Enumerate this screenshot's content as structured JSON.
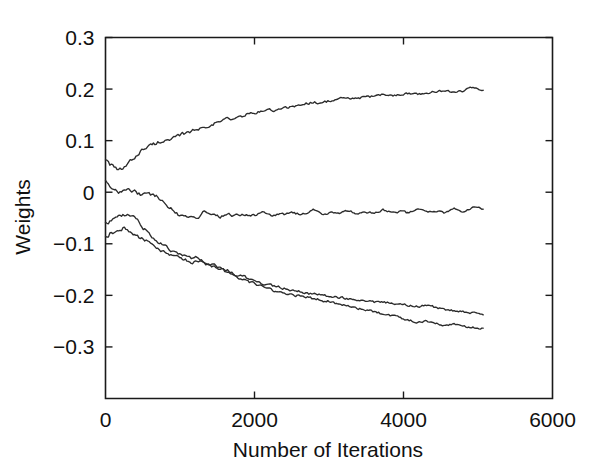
{
  "chart_data": {
    "type": "line",
    "title": "",
    "xlabel": "Number of Iterations",
    "ylabel": "Weights",
    "xlim": [
      0,
      6000
    ],
    "ylim": [
      -0.4,
      0.3
    ],
    "xticks": [
      0,
      2000,
      4000,
      6000
    ],
    "xtick_labels": [
      "0",
      "2000",
      "4000",
      "6000"
    ],
    "yticks": [
      -0.3,
      -0.2,
      -0.1,
      0,
      0.1,
      0.2,
      0.3
    ],
    "ytick_labels": [
      "−0.3",
      "−0.2",
      "−0.1",
      "0",
      "0.1",
      "0.2",
      "0.3"
    ],
    "grid": false,
    "legend": null,
    "x_data_range": [
      0,
      5070
    ],
    "line_color": "#2b2b2b",
    "series": [
      {
        "name": "weight-1",
        "start_value": 0.066,
        "end_value": 0.196,
        "x": [
          0,
          60,
          120,
          180,
          240,
          300,
          360,
          420,
          480,
          540,
          600,
          680,
          760,
          840,
          920,
          1000,
          1080,
          1160,
          1240,
          1320,
          1400,
          1480,
          1560,
          1640,
          1720,
          1800,
          1900,
          2000,
          2100,
          2200,
          2300,
          2400,
          2500,
          2600,
          2700,
          2800,
          2900,
          3000,
          3120,
          3240,
          3360,
          3480,
          3600,
          3720,
          3840,
          3960,
          4080,
          4200,
          4320,
          4440,
          4560,
          4680,
          4800,
          4920,
          5070
        ],
        "values": [
          0.066,
          0.055,
          0.046,
          0.041,
          0.046,
          0.054,
          0.063,
          0.073,
          0.081,
          0.086,
          0.09,
          0.095,
          0.101,
          0.099,
          0.104,
          0.11,
          0.115,
          0.119,
          0.122,
          0.126,
          0.131,
          0.134,
          0.139,
          0.143,
          0.141,
          0.146,
          0.151,
          0.153,
          0.157,
          0.16,
          0.158,
          0.163,
          0.166,
          0.169,
          0.172,
          0.175,
          0.173,
          0.177,
          0.18,
          0.183,
          0.181,
          0.184,
          0.186,
          0.189,
          0.187,
          0.19,
          0.192,
          0.19,
          0.193,
          0.195,
          0.197,
          0.194,
          0.197,
          0.203,
          0.196
        ]
      },
      {
        "name": "weight-2",
        "start_value": 0.02,
        "end_value": -0.032,
        "x": [
          0,
          60,
          120,
          180,
          240,
          300,
          360,
          420,
          480,
          540,
          600,
          680,
          760,
          840,
          920,
          1000,
          1080,
          1160,
          1240,
          1320,
          1400,
          1480,
          1560,
          1640,
          1720,
          1800,
          1900,
          2000,
          2100,
          2200,
          2300,
          2400,
          2500,
          2600,
          2700,
          2800,
          2900,
          3000,
          3120,
          3240,
          3360,
          3480,
          3600,
          3720,
          3840,
          3960,
          4080,
          4200,
          4320,
          4440,
          4560,
          4680,
          4800,
          4920,
          5070
        ],
        "values": [
          0.02,
          0.014,
          0.006,
          -0.001,
          0.004,
          0.006,
          0.004,
          -0.001,
          -0.004,
          -0.002,
          -0.004,
          -0.008,
          -0.016,
          -0.026,
          -0.037,
          -0.046,
          -0.047,
          -0.046,
          -0.05,
          -0.038,
          -0.045,
          -0.047,
          -0.047,
          -0.04,
          -0.047,
          -0.044,
          -0.042,
          -0.046,
          -0.038,
          -0.045,
          -0.042,
          -0.044,
          -0.038,
          -0.043,
          -0.041,
          -0.035,
          -0.042,
          -0.04,
          -0.042,
          -0.035,
          -0.041,
          -0.039,
          -0.041,
          -0.034,
          -0.04,
          -0.038,
          -0.04,
          -0.033,
          -0.039,
          -0.038,
          -0.04,
          -0.031,
          -0.038,
          -0.029,
          -0.032
        ]
      },
      {
        "name": "weight-3",
        "start_value": -0.06,
        "end_value": -0.236,
        "x": [
          0,
          60,
          120,
          180,
          240,
          300,
          360,
          420,
          480,
          540,
          600,
          680,
          760,
          840,
          920,
          1000,
          1080,
          1160,
          1240,
          1320,
          1400,
          1480,
          1560,
          1640,
          1720,
          1800,
          1900,
          2000,
          2100,
          2200,
          2300,
          2400,
          2500,
          2600,
          2700,
          2800,
          2900,
          3000,
          3120,
          3240,
          3360,
          3480,
          3600,
          3720,
          3840,
          3960,
          4080,
          4200,
          4320,
          4440,
          4560,
          4680,
          4800,
          4920,
          5070
        ],
        "values": [
          -0.06,
          -0.058,
          -0.05,
          -0.046,
          -0.044,
          -0.043,
          -0.048,
          -0.055,
          -0.064,
          -0.074,
          -0.084,
          -0.094,
          -0.1,
          -0.108,
          -0.118,
          -0.122,
          -0.126,
          -0.13,
          -0.127,
          -0.134,
          -0.14,
          -0.143,
          -0.148,
          -0.152,
          -0.158,
          -0.162,
          -0.166,
          -0.17,
          -0.176,
          -0.18,
          -0.183,
          -0.186,
          -0.19,
          -0.193,
          -0.196,
          -0.198,
          -0.2,
          -0.203,
          -0.204,
          -0.206,
          -0.209,
          -0.211,
          -0.213,
          -0.212,
          -0.216,
          -0.218,
          -0.22,
          -0.222,
          -0.219,
          -0.224,
          -0.228,
          -0.23,
          -0.232,
          -0.234,
          -0.236
        ]
      },
      {
        "name": "weight-4",
        "start_value": -0.086,
        "end_value": -0.264,
        "x": [
          0,
          60,
          120,
          180,
          240,
          300,
          360,
          420,
          480,
          540,
          600,
          680,
          760,
          840,
          920,
          1000,
          1080,
          1160,
          1240,
          1320,
          1400,
          1480,
          1560,
          1640,
          1720,
          1800,
          1900,
          2000,
          2100,
          2200,
          2300,
          2400,
          2500,
          2600,
          2700,
          2800,
          2900,
          3000,
          3120,
          3240,
          3360,
          3480,
          3600,
          3720,
          3840,
          3960,
          4080,
          4200,
          4320,
          4440,
          4560,
          4680,
          4800,
          4920,
          5070
        ],
        "values": [
          -0.086,
          -0.08,
          -0.076,
          -0.072,
          -0.07,
          -0.074,
          -0.08,
          -0.086,
          -0.09,
          -0.094,
          -0.1,
          -0.107,
          -0.114,
          -0.118,
          -0.122,
          -0.126,
          -0.132,
          -0.136,
          -0.134,
          -0.137,
          -0.142,
          -0.146,
          -0.15,
          -0.156,
          -0.16,
          -0.166,
          -0.172,
          -0.178,
          -0.182,
          -0.188,
          -0.192,
          -0.194,
          -0.198,
          -0.2,
          -0.204,
          -0.206,
          -0.21,
          -0.212,
          -0.216,
          -0.22,
          -0.224,
          -0.228,
          -0.232,
          -0.236,
          -0.24,
          -0.244,
          -0.248,
          -0.252,
          -0.25,
          -0.254,
          -0.258,
          -0.256,
          -0.26,
          -0.262,
          -0.264
        ]
      }
    ]
  }
}
